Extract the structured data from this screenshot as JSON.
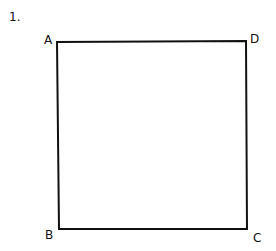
{
  "figure": {
    "number_label": "1.",
    "shape": "square",
    "vertices": [
      {
        "label": "A",
        "position": "top-left"
      },
      {
        "label": "D",
        "position": "top-right"
      },
      {
        "label": "B",
        "position": "bottom-left"
      },
      {
        "label": "C",
        "position": "bottom-right"
      }
    ],
    "stroke_color": "#111111"
  }
}
